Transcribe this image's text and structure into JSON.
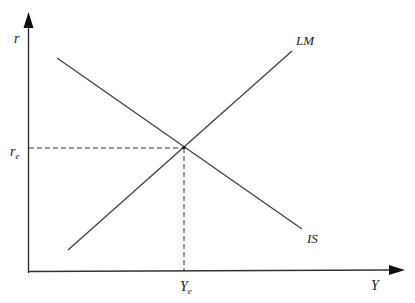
{
  "diagram": {
    "colors": {
      "axis": "#333333",
      "curve": "#404040",
      "dashed": "#333333",
      "text": "#1a1a1a"
    },
    "axes": {
      "y_label": "r",
      "x_label": "Y"
    },
    "curves": [
      {
        "name": "LM",
        "label": "LM",
        "from": [
          68,
          250
        ],
        "to": [
          292,
          51
        ],
        "slope": "upward"
      },
      {
        "name": "IS",
        "label": "IS",
        "from": [
          57,
          58
        ],
        "to": [
          302,
          229
        ],
        "slope": "downward"
      }
    ],
    "equilibrium": {
      "point": [
        184,
        147
      ],
      "r_label_base": "r",
      "r_label_sub": "e",
      "y_label_base": "Y",
      "y_label_sub": "e"
    }
  }
}
